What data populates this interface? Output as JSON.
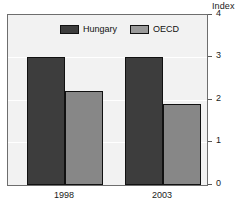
{
  "chart_data": {
    "type": "bar",
    "title": "",
    "subtitle": "",
    "xlabel": "",
    "ylabel": "Index",
    "unit_label": "Index",
    "categories": [
      "1998",
      "2003"
    ],
    "series": [
      {
        "name": "Hungary",
        "color": "#3d3d3d",
        "values": [
          3.0,
          3.0
        ]
      },
      {
        "name": "OECD",
        "color": "#878787",
        "values": [
          2.2,
          1.9
        ]
      }
    ],
    "ylim": [
      0,
      4
    ],
    "yticks": [
      0,
      1,
      2,
      3,
      4
    ],
    "ytick_labels": [
      "0",
      "1",
      "2",
      "3",
      "4"
    ],
    "grid": true,
    "gridlines_at": [
      1,
      2,
      3
    ],
    "y_axis_position": "right",
    "legend_position": "top-center",
    "plot_background": "#f2f2f2",
    "frame_color": "#6e6e6e"
  },
  "legend": {
    "entries": [
      {
        "label": "Hungary",
        "swatch": "legend-swatch-hungary"
      },
      {
        "label": "OECD",
        "swatch": "legend-swatch-oecd"
      }
    ]
  },
  "axis": {
    "unit": "Index",
    "ticks": [
      "4",
      "3",
      "2",
      "1",
      "0"
    ]
  },
  "x_axis": {
    "labels": [
      "1998",
      "2003"
    ]
  }
}
